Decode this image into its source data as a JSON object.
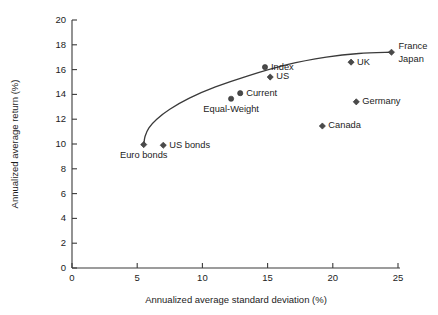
{
  "chart_data": {
    "type": "scatter",
    "title": "",
    "xlabel": "Annualized average standard deviation (%)",
    "ylabel": "Annualized average return (%)",
    "xlim": [
      0,
      25
    ],
    "ylim": [
      0,
      20
    ],
    "xticks": [
      0,
      5,
      10,
      15,
      20,
      25
    ],
    "yticks": [
      0,
      2,
      4,
      6,
      8,
      10,
      12,
      14,
      16,
      18,
      20
    ],
    "xtick_labels": [
      "0",
      "5",
      "10",
      "15",
      "20",
      "25"
    ],
    "ytick_labels": [
      "0",
      "2",
      "4",
      "6",
      "8",
      "10",
      "12",
      "14",
      "16",
      "18",
      "20"
    ],
    "grid": false,
    "legend": "none",
    "points": [
      {
        "label": "Euro bonds",
        "x": 5.5,
        "y": 9.95,
        "marker": "diamond",
        "label_pos": "below"
      },
      {
        "label": "US bonds",
        "x": 7.0,
        "y": 9.9,
        "marker": "diamond",
        "label_pos": "right"
      },
      {
        "label": "Equal-Weight",
        "x": 12.2,
        "y": 13.65,
        "marker": "circle",
        "label_pos": "below"
      },
      {
        "label": "Current",
        "x": 12.9,
        "y": 14.1,
        "marker": "circle",
        "label_pos": "right"
      },
      {
        "label": "Index",
        "x": 14.8,
        "y": 16.2,
        "marker": "circle",
        "label_pos": "right"
      },
      {
        "label": "US",
        "x": 15.2,
        "y": 15.4,
        "marker": "diamond",
        "label_pos": "right"
      },
      {
        "label": "Canada",
        "x": 19.2,
        "y": 11.45,
        "marker": "diamond",
        "label_pos": "right"
      },
      {
        "label": "UK",
        "x": 21.4,
        "y": 16.6,
        "marker": "diamond",
        "label_pos": "right"
      },
      {
        "label": "Germany",
        "x": 21.8,
        "y": 13.4,
        "marker": "diamond",
        "label_pos": "right"
      },
      {
        "label": "France",
        "x": 24.5,
        "y": 17.4,
        "marker": "diamond",
        "label_pos": "right-upper"
      },
      {
        "label": "Japan",
        "x": 24.5,
        "y": 17.4,
        "marker": "none",
        "label_pos": "right-lower"
      }
    ],
    "frontier_curve": {
      "description": "efficient frontier curve",
      "points": [
        [
          5.5,
          9.9
        ],
        [
          5.6,
          10.6
        ],
        [
          5.9,
          11.3
        ],
        [
          6.5,
          12.0
        ],
        [
          7.5,
          12.8
        ],
        [
          9.0,
          13.7
        ],
        [
          11.0,
          14.6
        ],
        [
          13.5,
          15.5
        ],
        [
          16.5,
          16.4
        ],
        [
          19.5,
          17.0
        ],
        [
          22.0,
          17.3
        ],
        [
          24.5,
          17.4
        ]
      ]
    }
  }
}
